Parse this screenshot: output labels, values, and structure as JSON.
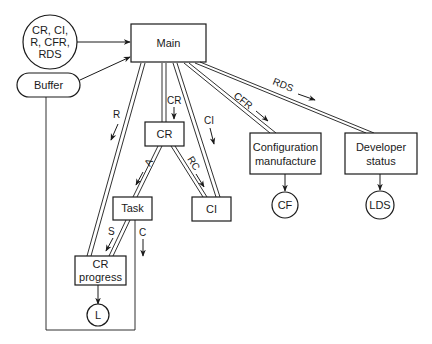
{
  "diagram": {
    "nodes": {
      "inputs": {
        "lines": [
          "CR, CI,",
          "R, CFR,",
          "RDS"
        ]
      },
      "buffer": {
        "label": "Buffer"
      },
      "main": {
        "label": "Main"
      },
      "cr": {
        "label": "CR"
      },
      "task": {
        "label": "Task"
      },
      "ci": {
        "label": "CI"
      },
      "cr_progress": {
        "lines": [
          "CR",
          "progress"
        ]
      },
      "l": {
        "label": "L"
      },
      "config": {
        "lines": [
          "Configuration",
          "manufacture"
        ]
      },
      "developer": {
        "lines": [
          "Developer",
          "status"
        ]
      },
      "cf": {
        "label": "CF"
      },
      "lds": {
        "label": "LDS"
      }
    },
    "flows": {
      "r": "R",
      "cr": "CR",
      "ci": "CI",
      "cfr": "CFR",
      "rds": "RDS",
      "a": "A",
      "rc": "RC",
      "s": "S",
      "c": "C"
    }
  }
}
